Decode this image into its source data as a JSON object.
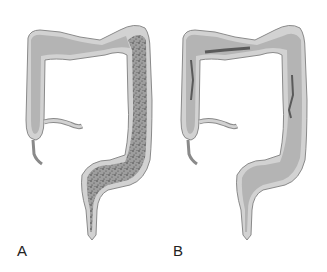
{
  "figure": {
    "panels": [
      {
        "id": "A",
        "label": "A",
        "pattern": "diffuse-stippled-involvement"
      },
      {
        "id": "B",
        "label": "B",
        "pattern": "linear-ulcers"
      }
    ],
    "colors": {
      "outer_wall": "#d2d2d2",
      "wall_outline": "#8a8a8a",
      "lumen": "#b4b4b4",
      "stipple": "#3a3a3a",
      "ulcer": "#5a5a5a",
      "background": "#ffffff"
    }
  }
}
